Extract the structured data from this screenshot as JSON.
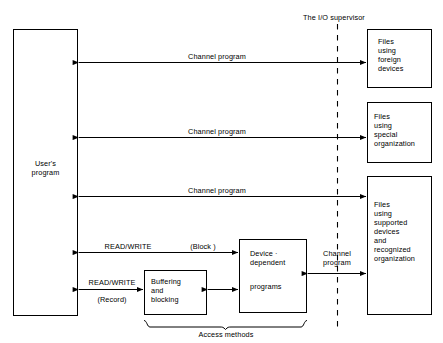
{
  "diagram": {
    "title_label": "The I/O supervisor",
    "boundary": {
      "name": "io-supervisor-boundary",
      "style": "dashed-vertical"
    },
    "nodes": [
      {
        "id": "users-program",
        "label": "User's\nprogram",
        "x": 13,
        "y": 29,
        "w": 65,
        "h": 287
      },
      {
        "id": "files-foreign",
        "label": "Files\nusing\nforeign\ndevices",
        "x": 367,
        "y": 29,
        "w": 65,
        "h": 59
      },
      {
        "id": "files-special",
        "label": "Files\nusing\nspecial\norganization",
        "x": 367,
        "y": 102,
        "w": 65,
        "h": 61
      },
      {
        "id": "files-supported",
        "label": "Files\nusing\nsupported\ndevices\nand\nrecognized\norganization",
        "x": 367,
        "y": 176,
        "w": 65,
        "h": 139
      },
      {
        "id": "buffering-blocking",
        "label": "Buffering\nand\nblocking",
        "x": 144,
        "y": 270,
        "w": 63,
        "h": 45
      },
      {
        "id": "device-dependent-programs",
        "label": "Device ·\ndependent\n\nprograms",
        "x": 239,
        "y": 239,
        "w": 68,
        "h": 74
      }
    ],
    "edges": [
      {
        "id": "channel-program-foreign",
        "label": "Channel program",
        "y": 62,
        "from_x": 78,
        "to_x": 367
      },
      {
        "id": "channel-program-special",
        "label": "Channel program",
        "y": 137,
        "from_x": 78,
        "to_x": 367
      },
      {
        "id": "channel-program-supported",
        "label": "Channel program",
        "y": 196,
        "from_x": 78,
        "to_x": 367
      },
      {
        "id": "read-write-block",
        "label_left": "READ/WRITE",
        "label_right": "(Block)",
        "y": 252,
        "from_x": 78,
        "to_x": 239
      },
      {
        "id": "read-write-record",
        "label_top": "READ/WRITE",
        "label_bottom": "(Record)",
        "y": 289,
        "from_x": 78,
        "to_x": 144
      },
      {
        "id": "buffering-to-device",
        "y": 289,
        "from_x": 207,
        "to_x": 239
      },
      {
        "id": "channel-program-device-files",
        "label": "Channel\nprogram",
        "y": 273,
        "from_x": 307,
        "to_x": 367
      }
    ],
    "brace": {
      "id": "access-methods-brace",
      "label": "Access methods",
      "x1": 144,
      "x2": 307,
      "y": 320
    },
    "colors": {
      "stroke": "#000000",
      "background": "#ffffff",
      "text": "#000000"
    }
  }
}
